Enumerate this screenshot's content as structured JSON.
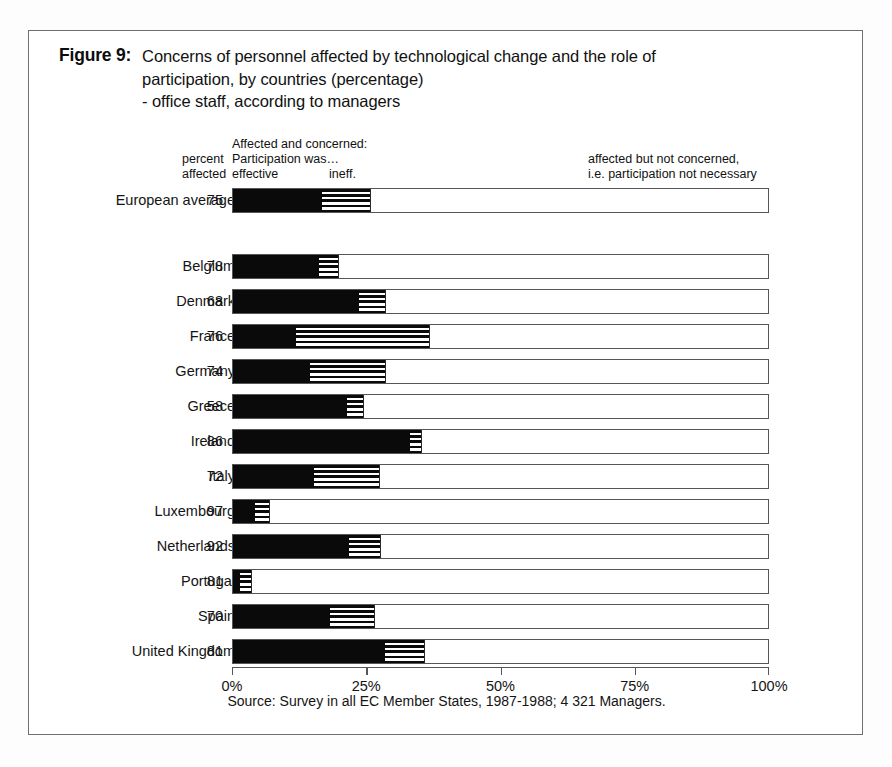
{
  "figure": {
    "label": "Figure 9:",
    "title_lines": [
      "Concerns of personnel affected by technological change and the role of",
      "participation, by countries (percentage)",
      "- office staff, according to managers"
    ],
    "source_note": "Source: Survey in all EC Member States, 1987-1988; 4 321 Managers."
  },
  "legend": {
    "percent": "percent",
    "affected": "affected",
    "affected_and_concerned": "Affected and concerned:",
    "participation_was": "Participation was…",
    "effective": "effective",
    "ineffective": "ineff.",
    "not_concerned_line1": "affected but not concerned,",
    "not_concerned_line2": "i.e. participation not necessary"
  },
  "axis": {
    "ticks": [
      "0%",
      "25%",
      "50%",
      "75%",
      "100%"
    ],
    "tick_values": [
      0,
      25,
      50,
      75,
      100
    ],
    "min": 0,
    "max": 100
  },
  "chart_data": {
    "type": "bar",
    "orientation": "horizontal",
    "stacked": true,
    "title": "Concerns of personnel affected by technological change and the role of participation, by countries (percentage) - office staff, according to managers",
    "xlabel": "",
    "ylabel": "",
    "xlim": [
      0,
      100
    ],
    "grid": false,
    "legend_position": "top",
    "categories": [
      "European average",
      "Belgium",
      "Denmark",
      "France",
      "Germany",
      "Greece",
      "Ireland",
      "Italy",
      "Luxembourg",
      "Netherlands",
      "Portugal",
      "Spain",
      "United Kingdom"
    ],
    "percent_affected": [
      75,
      78,
      68,
      76,
      74,
      58,
      86,
      72,
      97,
      92,
      81,
      70,
      81
    ],
    "series": [
      {
        "name": "Affected and concerned: Participation was effective",
        "pattern": "solid-black",
        "values": [
          16.5,
          16.0,
          23.5,
          11.7,
          14.3,
          21.2,
          33.0,
          15.0,
          4.1,
          21.6,
          1.3,
          18.1,
          28.3
        ]
      },
      {
        "name": "Affected and concerned: Participation was ineffective",
        "pattern": "horizontal-stripes",
        "values": [
          9.2,
          3.7,
          5.0,
          25.0,
          14.2,
          3.2,
          2.2,
          12.4,
          2.8,
          6.0,
          2.2,
          8.4,
          7.5
        ]
      },
      {
        "name": "Affected but not concerned, i.e. participation not necessary",
        "pattern": "white",
        "values": [
          74.3,
          80.3,
          71.5,
          63.3,
          71.5,
          75.6,
          64.8,
          72.6,
          93.1,
          72.4,
          96.5,
          73.5,
          64.2
        ]
      }
    ]
  },
  "rows": [
    {
      "label": "European average",
      "value": "75",
      "effective": 16.5,
      "ineff": 9.2
    },
    {
      "label": "Belgium",
      "value": "78",
      "effective": 16.0,
      "ineff": 3.7
    },
    {
      "label": "Denmark",
      "value": "68",
      "effective": 23.5,
      "ineff": 5.0
    },
    {
      "label": "France",
      "value": "76",
      "effective": 11.7,
      "ineff": 25.0
    },
    {
      "label": "Germany",
      "value": "74",
      "effective": 14.3,
      "ineff": 14.2
    },
    {
      "label": "Greece",
      "value": "58",
      "effective": 21.2,
      "ineff": 3.2
    },
    {
      "label": "Ireland",
      "value": "86",
      "effective": 33.0,
      "ineff": 2.2
    },
    {
      "label": "Italy",
      "value": "72",
      "effective": 15.0,
      "ineff": 12.4
    },
    {
      "label": "Luxembourg",
      "value": "97",
      "effective": 4.1,
      "ineff": 2.8
    },
    {
      "label": "Netherlands",
      "value": "92",
      "effective": 21.6,
      "ineff": 6.0
    },
    {
      "label": "Portugal",
      "value": "81",
      "effective": 1.3,
      "ineff": 2.2
    },
    {
      "label": "Spain",
      "value": "70",
      "effective": 18.1,
      "ineff": 8.4
    },
    {
      "label": "United Kingdom",
      "value": "81",
      "effective": 28.3,
      "ineff": 7.5
    }
  ]
}
